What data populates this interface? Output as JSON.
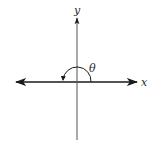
{
  "figure": {
    "colors": {
      "background": "#ffffff",
      "stroke": "#1a1a1a",
      "text": "#2a2a2a"
    },
    "axes": {
      "x_label": "x",
      "y_label": "y",
      "origin": [
        77,
        82
      ]
    },
    "angle": {
      "label": "θ",
      "radius": 14,
      "start_deg": 0,
      "end_deg": 180,
      "direction": "counterclockwise"
    }
  }
}
